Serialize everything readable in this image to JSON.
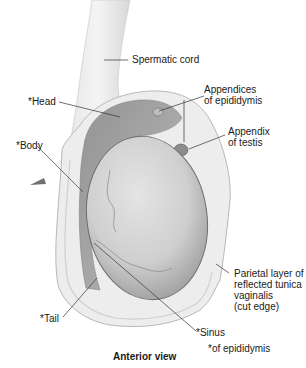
{
  "figure": {
    "view_caption": "Anterior view",
    "footnote": "*of epididymis",
    "labels": {
      "spermatic_cord": "Spermatic cord",
      "head": "*Head",
      "appendices_epididymis": "Appendices\nof epididymis",
      "appendix_testis": "Appendix\nof testis",
      "body": "*Body",
      "parietal_layer": "Parietal layer of\nreflected tunica\nvaginalis\n(cut edge)",
      "tail": "*Tail",
      "sinus": "*Sinus"
    }
  }
}
